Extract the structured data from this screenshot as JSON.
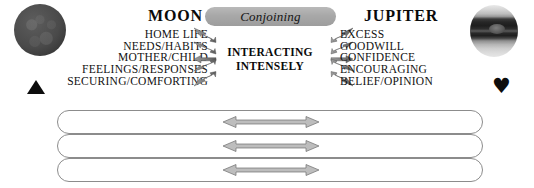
{
  "left_planet": {
    "name": "MOON",
    "graphic_icon": "moon-planet-icon",
    "symbol_glyph": "▲",
    "symbol_name": "triangle-glyph",
    "keywords": [
      "HOME LIFE",
      "NEEDS/HABITS",
      "MOTHER/CHILD",
      "FEELINGS/RESPONSES",
      "SECURING/COMFORTING"
    ]
  },
  "right_planet": {
    "name": "JUPITER",
    "graphic_icon": "jupiter-planet-icon",
    "symbol_glyph": "♥",
    "symbol_name": "heart-glyph",
    "keywords": [
      "EXCESS",
      "GOODWILL",
      "CONFIDENCE",
      "ENCOURAGING",
      "BELIEF/OPINION"
    ]
  },
  "aspect": {
    "label": "Conjoining",
    "pill_color": "#a8a8a8"
  },
  "center": {
    "line1": "INTERACTING",
    "line2": "INTENSELY"
  },
  "arrows": {
    "left_cluster_name": "moon-arrow-cluster",
    "right_cluster_name": "jupiter-arrow-cluster",
    "count": 5,
    "color": "#6e6e6e"
  },
  "stadium_bars": {
    "count": 3,
    "outline_color": "#8c8c8c",
    "fill_color": "#ffffff",
    "arrow_label": "double-headed-arrow",
    "arrow_color": "#b0b0b0"
  },
  "colors": {
    "text": "#111111",
    "background": "#ffffff",
    "accent_gray": "#a8a8a8"
  }
}
